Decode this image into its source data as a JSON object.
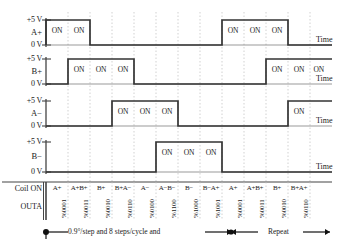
{
  "diagram": {
    "axis": {
      "high_label": "+5 V",
      "low_label": "0 V",
      "time_label": "Time"
    },
    "on_label": "ON",
    "signals": [
      {
        "name": "A+"
      },
      {
        "name": "B+"
      },
      {
        "name": "A−"
      },
      {
        "name": "B−"
      }
    ],
    "rows": {
      "coil_on_label": "Coil ON",
      "outa_label": "OUTA"
    },
    "columns": [
      {
        "coil": "A+",
        "outa": "%0001"
      },
      {
        "coil": "A+B+",
        "outa": "%0011"
      },
      {
        "coil": "B+",
        "outa": "%0010"
      },
      {
        "coil": "B+A−",
        "outa": "%0110"
      },
      {
        "coil": "A−",
        "outa": "%0100"
      },
      {
        "coil": "A−B−",
        "outa": "%1100"
      },
      {
        "coil": "B−",
        "outa": "%1000"
      },
      {
        "coil": "B−A+",
        "outa": "%1001"
      },
      {
        "coil": "A+",
        "outa": "%0001"
      },
      {
        "coil": "A+B+",
        "outa": "%0011"
      },
      {
        "coil": "B+",
        "outa": "%0010"
      },
      {
        "coil": "B+A+",
        "outa": "%0110"
      }
    ],
    "caption": {
      "spec": "0.9°/step and 8 steps/cycle and",
      "repeat": "Repeat"
    },
    "on_markers": {
      "a_plus": [
        "ON",
        "ON",
        "ON",
        "ON",
        "ON"
      ],
      "b_plus": [
        "ON",
        "ON",
        "ON",
        "ON",
        "ON",
        "ON"
      ],
      "a_minus": [
        "ON",
        "ON",
        "ON",
        "ON"
      ],
      "b_minus": [
        "ON",
        "ON",
        "ON"
      ]
    },
    "colors": {
      "trace": "#333333",
      "grid": "#bdbdbd",
      "axis": "#444444",
      "text": "#1a1a1a"
    }
  }
}
